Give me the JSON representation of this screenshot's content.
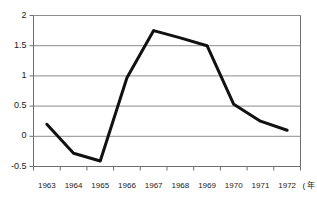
{
  "chart_data": {
    "type": "line",
    "title": "",
    "xlabel": "年",
    "ylabel": "",
    "x": [
      1963,
      1964,
      1965,
      1966,
      1967,
      1968,
      1969,
      1970,
      1971,
      1972
    ],
    "categories": [
      "1963",
      "1964",
      "1965",
      "1966",
      "1967",
      "1968",
      "1969",
      "1970",
      "1971",
      "1972"
    ],
    "values": [
      0.2,
      -0.28,
      -0.41,
      0.97,
      1.75,
      1.63,
      1.5,
      0.53,
      0.25,
      0.1
    ],
    "series": [
      {
        "name": "series-1",
        "values": [
          0.2,
          -0.28,
          -0.41,
          0.97,
          1.75,
          1.63,
          1.5,
          0.53,
          0.25,
          0.1
        ]
      }
    ],
    "ylim": [
      -0.5,
      2
    ],
    "xlim": [
      1962.5,
      1972.5
    ],
    "ytick_values": [
      2,
      1.5,
      1,
      0.5,
      0,
      -0.5
    ],
    "ytick_labels": [
      "2",
      "1.5",
      "1",
      "0.5",
      "0",
      "-0.5"
    ],
    "xtick_labels": [
      "1963",
      "1964",
      "1965",
      "1966",
      "1967",
      "1968",
      "1969",
      "1970",
      "1971",
      "1972"
    ],
    "grid": true,
    "grid_axis": "y",
    "legend": false,
    "legend_position": "none",
    "line_color": "#111111",
    "grid_color": "#8c8c8c",
    "axis_color": "#6e6e6e",
    "background_color": "#ffffff",
    "line_width": 3
  },
  "axis": {
    "x_unit_label": "( 年 )"
  },
  "caption": {
    "cropped_text": ""
  }
}
